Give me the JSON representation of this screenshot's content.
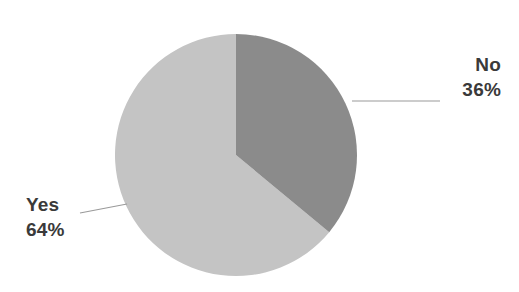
{
  "chart_data": {
    "type": "pie",
    "title": "",
    "categories": [
      "No",
      "Yes"
    ],
    "values": [
      36,
      64
    ],
    "value_unit": "%",
    "labels": [
      "36%",
      "64%"
    ],
    "start_angle_deg": 0,
    "direction": "clockwise",
    "legend": "none",
    "grid": false,
    "slices": [
      {
        "name": "No",
        "value": 36,
        "label": "36%",
        "color": "#8b8b8b",
        "start_angle_deg": 0,
        "end_angle_deg": 129.6,
        "leader_line": true
      },
      {
        "name": "Yes",
        "value": 64,
        "label": "64%",
        "color": "#c4c4c4",
        "start_angle_deg": 129.6,
        "end_angle_deg": 360,
        "leader_line": true
      }
    ]
  },
  "canvas": {
    "background_color": "#ffffff",
    "width": 519,
    "height": 292
  },
  "pie": {
    "center_x": 236,
    "center_y": 155,
    "radius": 121
  },
  "labels": {
    "no": {
      "name": "No",
      "percent": "36%"
    },
    "yes": {
      "name": "Yes",
      "percent": "64%"
    }
  },
  "style": {
    "label_text_color": "#3a3a3a",
    "leader_line_color": "#9a9a9a",
    "slice_no_color": "#8b8b8b",
    "slice_yes_color": "#c4c4c4"
  }
}
